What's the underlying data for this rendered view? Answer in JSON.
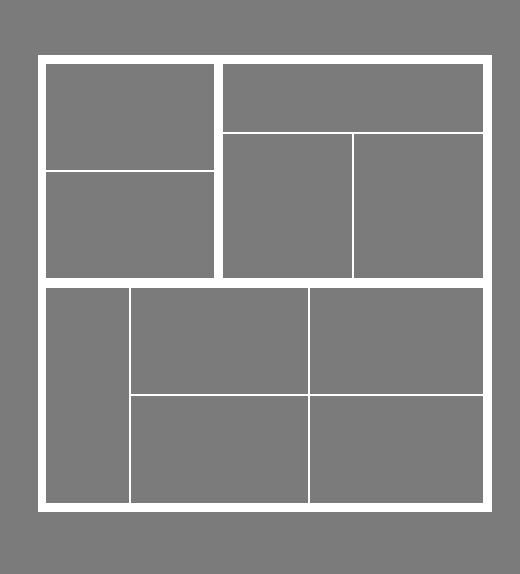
{
  "diagram": {
    "type": "panel-layout",
    "background_color": "#7b7b7b",
    "line_color": "#ffffff",
    "panel_color": "#7b7b7b",
    "frame": {
      "x": 38,
      "y": 55,
      "width": 454,
      "height": 457
    },
    "panels": [
      {
        "id": "top-left-upper",
        "x": 46,
        "y": 64,
        "w": 168,
        "h": 106
      },
      {
        "id": "top-left-lower",
        "x": 46,
        "y": 172,
        "w": 168,
        "h": 106
      },
      {
        "id": "top-right-upper",
        "x": 223,
        "y": 64,
        "w": 260,
        "h": 68
      },
      {
        "id": "top-right-lower-left",
        "x": 223,
        "y": 134,
        "w": 129,
        "h": 144
      },
      {
        "id": "top-right-lower-right",
        "x": 354,
        "y": 134,
        "w": 129,
        "h": 144
      },
      {
        "id": "bottom-left-tall",
        "x": 46,
        "y": 288,
        "w": 83,
        "h": 215
      },
      {
        "id": "bottom-middle-upper",
        "x": 131,
        "y": 288,
        "w": 177,
        "h": 106
      },
      {
        "id": "bottom-middle-lower",
        "x": 131,
        "y": 396,
        "w": 177,
        "h": 107
      },
      {
        "id": "bottom-right-upper",
        "x": 310,
        "y": 288,
        "w": 173,
        "h": 106
      },
      {
        "id": "bottom-right-lower",
        "x": 310,
        "y": 396,
        "w": 173,
        "h": 107
      }
    ]
  }
}
